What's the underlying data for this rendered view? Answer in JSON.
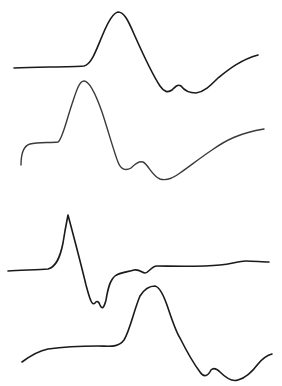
{
  "figure": {
    "width": 282,
    "height": 386,
    "background": "#ffffff",
    "traces": [
      {
        "id": "trace-1",
        "color": "#1a1a1a",
        "stroke_width": 1.6,
        "path": "M14,68 C40,67 70,67 84,66 C92,64 96,50 103,34 C108,22 113,13 118,12 C124,12 128,20 134,34 C142,52 152,74 160,86 C164,92 168,93 172,90 C176,86 178,84 181,86 C184,90 188,93 196,93 C204,92 210,86 218,78 C228,70 240,60 258,55"
      },
      {
        "id": "trace-2",
        "color": "#3a3a3a",
        "stroke_width": 1.4,
        "path": "M21,165 C21,155 23,146 30,144 C38,142 50,143 58,142 C62,140 66,122 72,104 C76,92 79,81 84,81 C90,81 96,95 102,112 C108,130 114,152 118,162 C121,170 126,171 131,168 C136,163 139,161 143,162 C148,164 152,176 160,179 C166,181 172,179 180,173 C190,166 200,158 212,150 C226,140 240,133 264,129"
      },
      {
        "id": "trace-3",
        "color": "#1a1a1a",
        "stroke_width": 1.6,
        "path": "M8,271 C20,270 38,270 48,269 C56,267 60,258 63,243 C65,230 67,220 68,215 C72,230 80,260 86,285 C90,300 92,306 95,303 C97,300 99,302 100,305 C102,310 104,308 106,300 C108,288 110,280 115,276 C120,272 128,272 134,270 C140,269 142,273 145,273 C149,273 151,266 157,266 C170,266 200,267 220,265 C232,264 238,261 246,261 C254,261 262,262 269,262"
      },
      {
        "id": "trace-4",
        "color": "#1a1a1a",
        "stroke_width": 1.6,
        "path": "M22,362 C30,356 38,351 48,349 C62,347 80,346 98,346 C110,346 118,348 124,340 C130,330 134,310 140,296 C145,288 150,286 155,286 C160,287 164,296 168,308 C172,320 176,332 180,338 C186,350 194,364 200,372 C204,378 208,376 211,370 C213,368 216,368 220,372 C226,378 232,382 238,380 C246,378 252,372 258,364 C263,358 268,355 272,354"
      }
    ]
  }
}
